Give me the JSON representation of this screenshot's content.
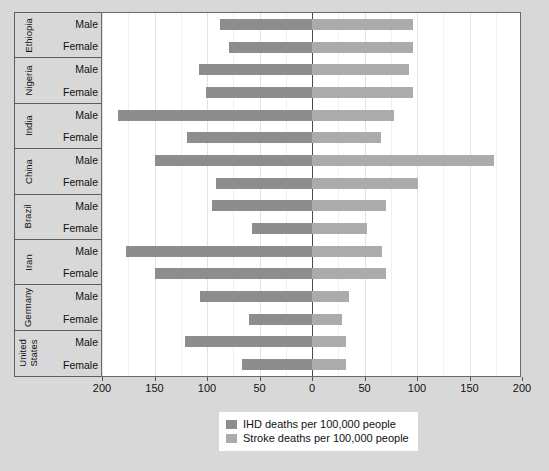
{
  "chart_data": {
    "type": "bar",
    "orientation": "horizontal-diverging",
    "title": "",
    "xlabel": "",
    "ylabel": "",
    "xlim": [
      -200,
      200
    ],
    "xticks": [
      -200,
      -150,
      -100,
      -50,
      0,
      50,
      100,
      150,
      200
    ],
    "xtick_labels": [
      "200",
      "150",
      "100",
      "50",
      "0",
      "50",
      "100",
      "150",
      "200"
    ],
    "grid": true,
    "legend_position": "bottom-center",
    "series": [
      {
        "name": "IHD deaths per 100,000 people",
        "color": "#8d8d8d",
        "side": "left"
      },
      {
        "name": "Stroke deaths per 100,000 people",
        "color": "#ababab",
        "side": "right"
      }
    ],
    "categories": [
      "Ethiopia",
      "Nigeria",
      "India",
      "China",
      "Brazil",
      "Iran",
      "Germany",
      "United States"
    ],
    "subcategories": [
      "Male",
      "Female"
    ],
    "rows": [
      {
        "country": "Ethiopia",
        "country_lines": [
          "Ethiopia"
        ],
        "sexes": [
          {
            "sex": "Male",
            "ihd": 88,
            "stroke": 96
          },
          {
            "sex": "Female",
            "ihd": 79,
            "stroke": 96
          }
        ]
      },
      {
        "country": "Nigeria",
        "country_lines": [
          "Nigeria"
        ],
        "sexes": [
          {
            "sex": "Male",
            "ihd": 108,
            "stroke": 92
          },
          {
            "sex": "Female",
            "ihd": 101,
            "stroke": 96
          }
        ]
      },
      {
        "country": "India",
        "country_lines": [
          "India"
        ],
        "sexes": [
          {
            "sex": "Male",
            "ihd": 185,
            "stroke": 78
          },
          {
            "sex": "Female",
            "ihd": 119,
            "stroke": 66
          }
        ]
      },
      {
        "country": "China",
        "country_lines": [
          "China"
        ],
        "sexes": [
          {
            "sex": "Male",
            "ihd": 150,
            "stroke": 173
          },
          {
            "sex": "Female",
            "ihd": 91,
            "stroke": 101
          }
        ]
      },
      {
        "country": "Brazil",
        "country_lines": [
          "Brazil"
        ],
        "sexes": [
          {
            "sex": "Male",
            "ihd": 95,
            "stroke": 70
          },
          {
            "sex": "Female",
            "ihd": 57,
            "stroke": 52
          }
        ]
      },
      {
        "country": "Iran",
        "country_lines": [
          "Iran"
        ],
        "sexes": [
          {
            "sex": "Male",
            "ihd": 177,
            "stroke": 67
          },
          {
            "sex": "Female",
            "ihd": 150,
            "stroke": 70
          }
        ]
      },
      {
        "country": "Germany",
        "country_lines": [
          "Germany"
        ],
        "sexes": [
          {
            "sex": "Male",
            "ihd": 107,
            "stroke": 35
          },
          {
            "sex": "Female",
            "ihd": 60,
            "stroke": 29
          }
        ]
      },
      {
        "country": "United States",
        "country_lines": [
          "United",
          "States"
        ],
        "sexes": [
          {
            "sex": "Male",
            "ihd": 121,
            "stroke": 32
          },
          {
            "sex": "Female",
            "ihd": 67,
            "stroke": 32
          }
        ]
      }
    ]
  },
  "legend": {
    "items": [
      {
        "label": "IHD deaths per 100,000 people",
        "color": "#8d8d8d"
      },
      {
        "label": "Stroke deaths per 100,000 people",
        "color": "#ababab"
      }
    ]
  },
  "colors": {
    "ihd": "#8d8d8d",
    "stroke": "#ababab",
    "background": "#d8d8d8",
    "plot_background": "#ffffff",
    "axis": "#5d5d5d",
    "grid": "#e2e2e2"
  }
}
